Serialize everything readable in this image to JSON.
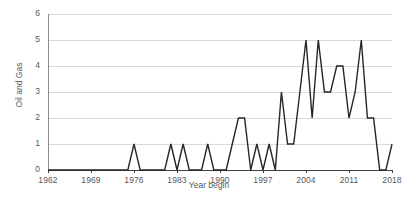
{
  "chart_data": {
    "type": "line",
    "title": "",
    "xlabel": "Year begin",
    "ylabel": "Oil and Gas",
    "xlim": [
      1962,
      2018
    ],
    "ylim": [
      0,
      6
    ],
    "grid": true,
    "legend": null,
    "xticks": [
      1962,
      1969,
      1976,
      1983,
      1990,
      1997,
      2004,
      2011,
      2018
    ],
    "yticks": [
      0,
      1,
      2,
      3,
      4,
      5,
      6
    ],
    "line_color": "#262626",
    "grid_color": "#d9d9d9",
    "axis_color": "#404040",
    "series": [
      {
        "name": "Oil and Gas",
        "x": [
          1962,
          1963,
          1964,
          1965,
          1966,
          1967,
          1968,
          1969,
          1970,
          1971,
          1972,
          1973,
          1974,
          1975,
          1976,
          1977,
          1978,
          1979,
          1980,
          1981,
          1982,
          1983,
          1984,
          1985,
          1986,
          1987,
          1988,
          1989,
          1990,
          1991,
          1992,
          1993,
          1994,
          1995,
          1996,
          1997,
          1998,
          1999,
          2000,
          2001,
          2002,
          2003,
          2004,
          2005,
          2006,
          2007,
          2008,
          2009,
          2010,
          2011,
          2012,
          2013,
          2014,
          2015,
          2016,
          2017,
          2018
        ],
        "values": [
          0,
          0,
          0,
          0,
          0,
          0,
          0,
          0,
          0,
          0,
          0,
          0,
          0,
          0,
          1,
          0,
          0,
          0,
          0,
          0,
          1,
          0,
          1,
          0,
          0,
          0,
          1,
          0,
          0,
          0,
          1,
          2,
          2,
          0,
          1,
          0,
          1,
          0,
          3,
          1,
          1,
          3,
          5,
          2,
          5,
          3,
          3,
          4,
          4,
          2,
          3,
          5,
          2,
          2,
          0,
          0,
          1
        ]
      }
    ]
  },
  "axes": {
    "y_tick_labels": [
      "6",
      "5",
      "4",
      "3",
      "2",
      "1",
      "0"
    ],
    "x_tick_labels": [
      "1962",
      "1969",
      "1976",
      "1983",
      "1990",
      "1997",
      "2004",
      "2011",
      "2018"
    ],
    "y_axis_title": "Oil and Gas",
    "x_axis_title": "Year begin"
  }
}
